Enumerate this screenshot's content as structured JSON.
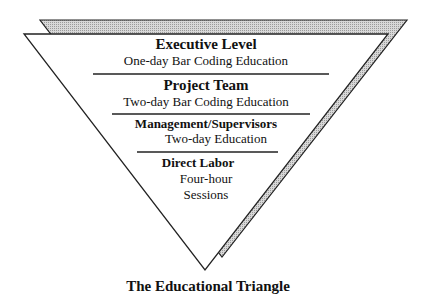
{
  "diagram": {
    "caption": "The Educational Triangle",
    "levels": [
      {
        "title": "Executive Level",
        "detail": "One-day Bar Coding  Education"
      },
      {
        "title": "Project Team",
        "detail": "Two-day Bar Coding Education"
      },
      {
        "title": "Management/Supervisors",
        "detail": "Two-day Education"
      },
      {
        "title": "Direct Labor",
        "detail_lines": [
          "Four-hour",
          "Sessions"
        ]
      }
    ]
  }
}
